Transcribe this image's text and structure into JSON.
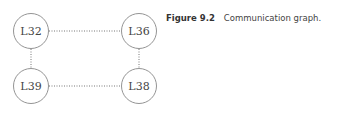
{
  "caption": {
    "number": "Figure 9.2",
    "text": "Communication graph."
  },
  "nodes": [
    {
      "id": "L32",
      "label": "L32",
      "cx": 31,
      "cy": 31
    },
    {
      "id": "L36",
      "label": "L36",
      "cx": 139,
      "cy": 31
    },
    {
      "id": "L39",
      "label": "L39",
      "cx": 31,
      "cy": 86
    },
    {
      "id": "L38",
      "label": "L38",
      "cx": 139,
      "cy": 86
    }
  ],
  "edges": [
    {
      "from": "L32",
      "to": "L36",
      "style": "dotted"
    },
    {
      "from": "L32",
      "to": "L39",
      "style": "dotted"
    },
    {
      "from": "L36",
      "to": "L38",
      "style": "dotted"
    },
    {
      "from": "L39",
      "to": "L38",
      "style": "dotted"
    }
  ],
  "colors": {
    "stroke": "#888888",
    "edge": "#777777",
    "text": "#444444"
  }
}
